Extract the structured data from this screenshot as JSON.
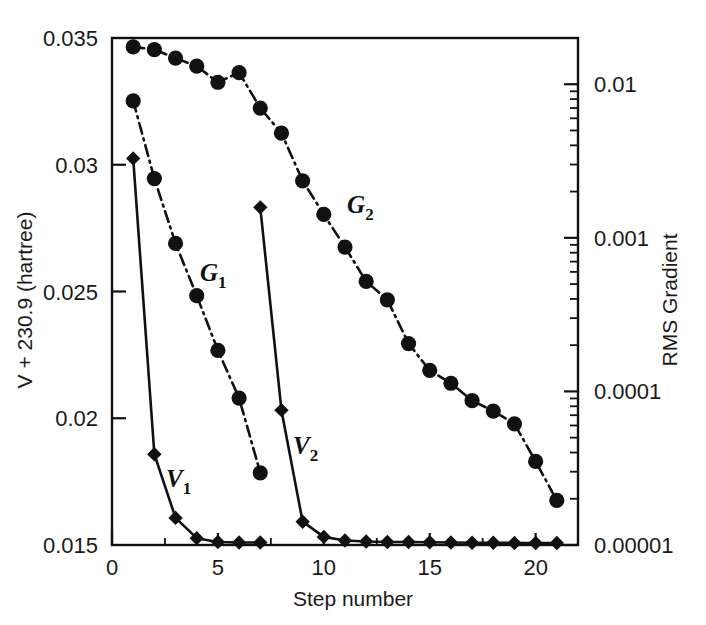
{
  "figure": {
    "title": "",
    "background_color": "#ffffff",
    "ink_color": "#111111"
  },
  "axes": {
    "x": {
      "label": "Step number",
      "min": 0,
      "max": 22,
      "major_ticks": [
        0,
        5,
        10,
        15,
        20
      ],
      "major_tick_labels": [
        "0",
        "5",
        "10",
        "15",
        "20"
      ],
      "minor_ticks": [
        2.5,
        7.5,
        12.5,
        17.5
      ]
    },
    "y_left": {
      "label": "V + 230.9 (hartree)",
      "min": 0.015,
      "max": 0.035,
      "scale": "linear",
      "major_ticks": [
        0.015,
        0.02,
        0.025,
        0.03,
        0.035
      ],
      "major_tick_labels": [
        "0.015",
        "0.02",
        "0.025",
        "0.03",
        "0.035"
      ]
    },
    "y_right": {
      "label": "RMS Gradient",
      "min": 1e-05,
      "max": 0.02,
      "scale": "log",
      "major_ticks": [
        0.01,
        0.001,
        0.0001,
        1e-05
      ],
      "major_tick_labels": [
        "0.01",
        "0.001",
        "0.0001",
        "0.00001"
      ]
    }
  },
  "legend": {
    "position": "inline-annotations",
    "entries": [
      {
        "key": "V1",
        "base": "V",
        "sub": "1",
        "axis": "left",
        "marker": "diamond",
        "line": "solid"
      },
      {
        "key": "V2",
        "base": "V",
        "sub": "2",
        "axis": "left",
        "marker": "diamond",
        "line": "solid"
      },
      {
        "key": "G1",
        "base": "G",
        "sub": "1",
        "axis": "right",
        "marker": "circle",
        "line": "dash-dot"
      },
      {
        "key": "G2",
        "base": "G",
        "sub": "2",
        "axis": "right",
        "marker": "circle",
        "line": "dash-dot"
      }
    ]
  },
  "annotations": [
    {
      "name": "label-V1",
      "text_base": "V",
      "text_sub": "1",
      "x": 2.55,
      "y_left": 0.0173
    },
    {
      "name": "label-V2",
      "text_base": "V",
      "text_sub": "2",
      "x": 8.55,
      "y_left": 0.0186
    },
    {
      "name": "label-G1",
      "text_base": "G",
      "text_sub": "1",
      "x": 4.15,
      "y_left": 0.0254
    },
    {
      "name": "label-G2",
      "text_base": "G",
      "text_sub": "2",
      "x": 11.1,
      "y_left": 0.0281
    }
  ],
  "chart_data": {
    "type": "line",
    "title": "",
    "xlabel": "Step number",
    "ylabel": "V + 230.9 (hartree)",
    "ylabel_secondary": "RMS Gradient",
    "xlim": [
      0,
      22
    ],
    "ylim": [
      0.015,
      0.035
    ],
    "ylim_secondary": [
      1e-05,
      0.02
    ],
    "yscale": "linear",
    "yscale_secondary": "log",
    "grid": false,
    "legend_position": "inline-annotations",
    "series": [
      {
        "name": "V1",
        "axis": "left",
        "marker": "diamond",
        "linestyle": "solid",
        "x": [
          1,
          2,
          3,
          4,
          5,
          6,
          7
        ],
        "values": [
          0.03025,
          0.01858,
          0.01607,
          0.01527,
          0.01512,
          0.0151,
          0.0151
        ]
      },
      {
        "name": "V2",
        "axis": "left",
        "marker": "diamond",
        "linestyle": "solid",
        "x": [
          7,
          8,
          9,
          10,
          11,
          12,
          13,
          14,
          15,
          16,
          17,
          18,
          19,
          20,
          21
        ],
        "values": [
          0.02832,
          0.02032,
          0.01592,
          0.01532,
          0.01518,
          0.01514,
          0.01512,
          0.01512,
          0.01511,
          0.0151,
          0.01509,
          0.01509,
          0.01508,
          0.01508,
          0.01508
        ]
      },
      {
        "name": "G1",
        "axis": "right",
        "marker": "circle",
        "linestyle": "dash-dot",
        "x": [
          1,
          2,
          3,
          4,
          5,
          6,
          7
        ],
        "values": [
          0.0078,
          0.00243,
          0.00092,
          0.00042,
          0.000185,
          9.05e-05,
          2.95e-05
        ]
      },
      {
        "name": "G2",
        "axis": "right",
        "marker": "circle",
        "linestyle": "dash-dot",
        "x": [
          1,
          2,
          3,
          4,
          5,
          6,
          7,
          8,
          9,
          10,
          11,
          12,
          13,
          14,
          15,
          16,
          17,
          18,
          19,
          20,
          21
        ],
        "values": [
          0.0175,
          0.0168,
          0.0148,
          0.0131,
          0.0103,
          0.0119,
          0.007,
          0.0048,
          0.00235,
          0.00142,
          0.00087,
          0.00052,
          0.000395,
          0.000205,
          0.000137,
          0.000113,
          8.7e-05,
          7.45e-05,
          6.15e-05,
          3.5e-05,
          1.95e-05
        ]
      }
    ]
  }
}
